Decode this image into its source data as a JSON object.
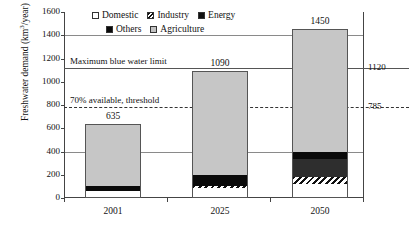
{
  "chart_data": {
    "type": "bar",
    "subtype": "stacked-vertical",
    "title": "",
    "xlabel": "",
    "ylabel": "Freshwater demand (km3/year)",
    "ylabel_prefix": "Freshwater demand (km",
    "ylabel_exponent": "3",
    "ylabel_suffix": "/year)",
    "categories": [
      "2001",
      "2025",
      "2050"
    ],
    "ylim": [
      0,
      1600
    ],
    "yticks": [
      0,
      200,
      400,
      600,
      800,
      1000,
      1200,
      1400,
      1600
    ],
    "ytick_labels": [
      "0",
      "200",
      "400",
      "600",
      "800",
      "1000",
      "1200",
      "1400",
      "1600"
    ],
    "grid": true,
    "legend_position": "top",
    "series": [
      {
        "name": "Domestic",
        "values": [
          50,
          80,
          115
        ],
        "pattern": "white"
      },
      {
        "name": "Industry",
        "values": [
          0,
          20,
          60
        ],
        "pattern": "hatch"
      },
      {
        "name": "Energy",
        "values": [
          0,
          0,
          155
        ],
        "pattern": "darkgray"
      },
      {
        "name": "Others",
        "values": [
          45,
          95,
          60
        ],
        "pattern": "black"
      },
      {
        "name": "Agriculture",
        "values": [
          540,
          895,
          1060
        ],
        "pattern": "gray"
      }
    ],
    "totals": [
      635,
      1090,
      1450
    ],
    "total_labels": [
      "635",
      "1090",
      "1450"
    ],
    "reference_lines": [
      {
        "label": "Maximum blue water limit",
        "value": 1120,
        "right_label": "1120",
        "style": "solid"
      },
      {
        "label": "70% available, threshold",
        "value": 785,
        "right_label": "785",
        "style": "dashed"
      }
    ]
  },
  "legend": {
    "row1": [
      {
        "label": "Domestic",
        "swatch": "domestic-swatch-icon"
      },
      {
        "label": "Industry",
        "swatch": "industry-swatch-icon"
      },
      {
        "label": "Energy",
        "swatch": "energy-swatch-icon"
      }
    ],
    "row2": [
      {
        "label": "Others",
        "swatch": "others-swatch-icon"
      },
      {
        "label": "Agriculture",
        "swatch": "agriculture-swatch-icon"
      }
    ]
  },
  "colors": {
    "domestic": "#ffffff",
    "industry": "#111111",
    "energy": "#2e2e2e",
    "others": "#0a0a0a",
    "agriculture": "#c6c6c6",
    "axis": "#444444",
    "grid": "#8a8a8a"
  }
}
